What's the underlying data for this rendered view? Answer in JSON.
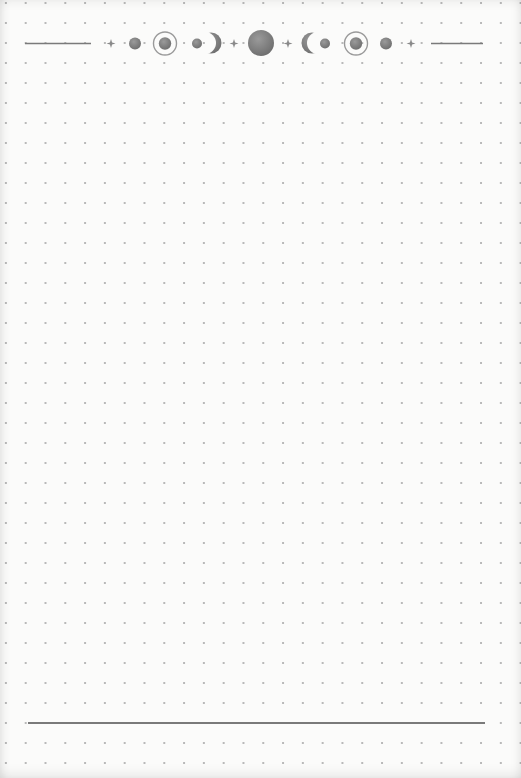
{
  "page": {
    "type": "dot-grid notebook page",
    "dot_spacing_px": 20,
    "background_color": "#fbfbfa",
    "dot_color": "#b9b9b9"
  },
  "header": {
    "decoration": "moon phase banner",
    "ink_color": "#7c7c7c",
    "elements": [
      {
        "kind": "line",
        "name": "left-rule"
      },
      {
        "kind": "sparkle"
      },
      {
        "kind": "dot"
      },
      {
        "kind": "ringed-dot"
      },
      {
        "kind": "dot-with-crescent-right"
      },
      {
        "kind": "sparkle"
      },
      {
        "kind": "full-moon"
      },
      {
        "kind": "sparkle"
      },
      {
        "kind": "crescent-left-with-dot"
      },
      {
        "kind": "ringed-dot"
      },
      {
        "kind": "dot"
      },
      {
        "kind": "sparkle"
      },
      {
        "kind": "line",
        "name": "right-rule"
      }
    ]
  },
  "footer": {
    "decoration": "horizontal rule",
    "line_color": "#7a7a7a"
  }
}
